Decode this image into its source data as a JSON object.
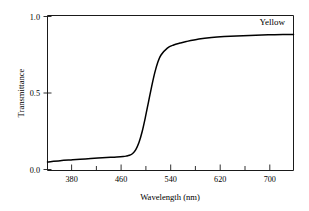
{
  "chart_data": {
    "type": "line",
    "title": "",
    "xlabel": "Wavelength (nm)",
    "ylabel": "Transmittance",
    "xlim": [
      340,
      730
    ],
    "ylim": [
      0.0,
      1.0
    ],
    "grid": false,
    "legend_position": "top-right-inline",
    "series": [
      {
        "name": "Yellow",
        "x": [
          340,
          360,
          380,
          400,
          420,
          440,
          450,
          460,
          465,
          470,
          475,
          480,
          485,
          490,
          495,
          500,
          505,
          510,
          515,
          520,
          530,
          540,
          550,
          560,
          580,
          600,
          620,
          650,
          680,
          700,
          730
        ],
        "values": [
          0.055,
          0.063,
          0.069,
          0.075,
          0.08,
          0.085,
          0.087,
          0.09,
          0.093,
          0.098,
          0.11,
          0.135,
          0.18,
          0.25,
          0.34,
          0.44,
          0.54,
          0.63,
          0.7,
          0.745,
          0.79,
          0.81,
          0.822,
          0.832,
          0.848,
          0.858,
          0.864,
          0.87,
          0.874,
          0.876,
          0.878
        ]
      }
    ],
    "x_major_ticks": [
      380,
      460,
      540,
      620,
      700
    ],
    "x_major_tick_labels": [
      "380",
      "460",
      "540",
      "620",
      "700"
    ],
    "x_minor_ticks": [
      340,
      420,
      500,
      580,
      660,
      730
    ],
    "y_major_ticks": [
      0.0,
      0.5,
      1.0
    ],
    "y_major_tick_labels": [
      "0.0",
      "0.5",
      "1.0"
    ],
    "colors": {
      "curve": "#000000",
      "axis": "#1a1a1a",
      "background": "#ffffff"
    }
  },
  "axes": {
    "y_tick_top": "1.0",
    "y_tick_mid": "0.5",
    "y_tick_bottom": "0.0",
    "x_tick_1": "380",
    "x_tick_2": "460",
    "x_tick_3": "540",
    "x_tick_4": "620",
    "x_tick_5": "700",
    "x_axis_title": "Wavelength (nm)",
    "y_axis_title": "Transmittance"
  },
  "annotations": {
    "series_label": "Yellow"
  }
}
